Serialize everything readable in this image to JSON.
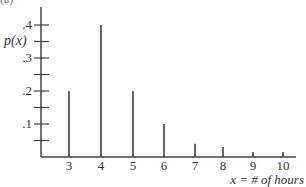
{
  "panel_label": "(a)",
  "chart_data": {
    "type": "bar",
    "style": "vertical-lines",
    "title": "",
    "xlabel": "x = # of hours",
    "ylabel": "p(x)",
    "categories": [
      "3",
      "4",
      "5",
      "6",
      "7",
      "8",
      "9",
      "10"
    ],
    "x": [
      3,
      4,
      5,
      6,
      7,
      8,
      9,
      10
    ],
    "values": [
      0.2,
      0.4,
      0.2,
      0.1,
      0.04,
      0.03,
      0.015,
      0.015
    ],
    "ylim": [
      0,
      0.45
    ],
    "yticks": [
      0.05,
      0.1,
      0.15,
      0.2,
      0.25,
      0.3,
      0.35,
      0.4
    ],
    "ytick_labels": [
      {
        "value": 0.1,
        "label": ".1"
      },
      {
        "value": 0.2,
        "label": ".2"
      },
      {
        "value": 0.3,
        "label": ".3"
      },
      {
        "value": 0.4,
        "label": ".4"
      }
    ],
    "grid": false,
    "legend": null
  },
  "colors": {
    "axis": "#444444",
    "bars": "#333333",
    "text": "#333333"
  }
}
